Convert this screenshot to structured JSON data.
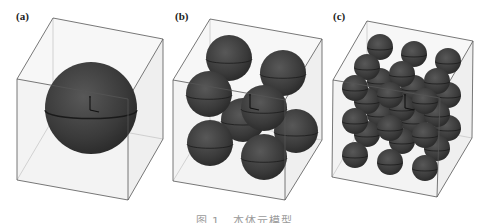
{
  "figure": {
    "caption": "图 1   本体元模型",
    "colors": {
      "sphere": "#3c3c3c",
      "sphere_highlight": "#5a5a5a",
      "equator": "#1a1a1a",
      "box_edge": "#555555",
      "box_face": "#f3f3f3",
      "axis": "#111111"
    },
    "panels": [
      {
        "label": "(a)",
        "label_pos": [
          16,
          10
        ],
        "box": {
          "back": [
            [
              53,
              18
            ],
            [
              163,
              39
            ],
            [
              163,
              139
            ],
            [
              53,
              119
            ]
          ],
          "front": [
            [
              17,
              79
            ],
            [
              128,
              99
            ],
            [
              128,
              200
            ],
            [
              17,
              180
            ]
          ]
        },
        "axis_origin": [
          90,
          110
        ],
        "spheres": [
          {
            "cx": 91,
            "cy": 108,
            "r": 46
          }
        ]
      },
      {
        "label": "(b)",
        "label_pos": [
          175,
          10
        ],
        "box": {
          "back": [
            [
              210,
              19
            ],
            [
              322,
              39
            ],
            [
              322,
              140
            ],
            [
              210,
              120
            ]
          ],
          "front": [
            [
              173,
              80
            ],
            [
              285,
              100
            ],
            [
              285,
              200
            ],
            [
              173,
              181
            ]
          ]
        },
        "axis_origin": [
          250,
          108
        ],
        "spheres": [
          {
            "cx": 243,
            "cy": 120,
            "r": 22
          },
          {
            "cx": 296,
            "cy": 131,
            "r": 22
          },
          {
            "cx": 229,
            "cy": 58,
            "r": 23
          },
          {
            "cx": 283,
            "cy": 73,
            "r": 23
          },
          {
            "cx": 210,
            "cy": 143,
            "r": 23
          },
          {
            "cx": 264,
            "cy": 157,
            "r": 23
          },
          {
            "cx": 209,
            "cy": 94,
            "r": 23
          },
          {
            "cx": 264,
            "cy": 108,
            "r": 23
          }
        ]
      },
      {
        "label": "(c)",
        "label_pos": [
          333,
          10
        ],
        "box": {
          "back": [
            [
              367,
              21
            ],
            [
              473,
              41
            ],
            [
              472,
              138
            ],
            [
              367,
              118
            ]
          ],
          "front": [
            [
              333,
              80
            ],
            [
              440,
              98
            ],
            [
              437,
              197
            ],
            [
              332,
              177
            ]
          ]
        },
        "axis_origin": [
          405,
          108
        ],
        "spheres": [
          {
            "cx": 380,
            "cy": 47,
            "r": 13
          },
          {
            "cx": 414,
            "cy": 54,
            "r": 13
          },
          {
            "cx": 448,
            "cy": 61,
            "r": 13
          },
          {
            "cx": 380,
            "cy": 81,
            "r": 13
          },
          {
            "cx": 414,
            "cy": 88,
            "r": 13
          },
          {
            "cx": 448,
            "cy": 95,
            "r": 13
          },
          {
            "cx": 380,
            "cy": 114,
            "r": 13
          },
          {
            "cx": 414,
            "cy": 121,
            "r": 13
          },
          {
            "cx": 448,
            "cy": 128,
            "r": 13
          },
          {
            "cx": 367,
            "cy": 67,
            "r": 13
          },
          {
            "cx": 402,
            "cy": 74,
            "r": 13
          },
          {
            "cx": 437,
            "cy": 81,
            "r": 13
          },
          {
            "cx": 367,
            "cy": 101,
            "r": 13
          },
          {
            "cx": 402,
            "cy": 108,
            "r": 13
          },
          {
            "cx": 437,
            "cy": 114,
            "r": 13
          },
          {
            "cx": 367,
            "cy": 134,
            "r": 13
          },
          {
            "cx": 402,
            "cy": 141,
            "r": 13
          },
          {
            "cx": 437,
            "cy": 148,
            "r": 13
          },
          {
            "cx": 355,
            "cy": 88,
            "r": 13
          },
          {
            "cx": 390,
            "cy": 95,
            "r": 13
          },
          {
            "cx": 425,
            "cy": 101,
            "r": 13
          },
          {
            "cx": 355,
            "cy": 121,
            "r": 13
          },
          {
            "cx": 390,
            "cy": 128,
            "r": 13
          },
          {
            "cx": 425,
            "cy": 135,
            "r": 13
          },
          {
            "cx": 355,
            "cy": 155,
            "r": 13
          },
          {
            "cx": 390,
            "cy": 162,
            "r": 13
          },
          {
            "cx": 425,
            "cy": 168,
            "r": 13
          }
        ]
      }
    ]
  }
}
